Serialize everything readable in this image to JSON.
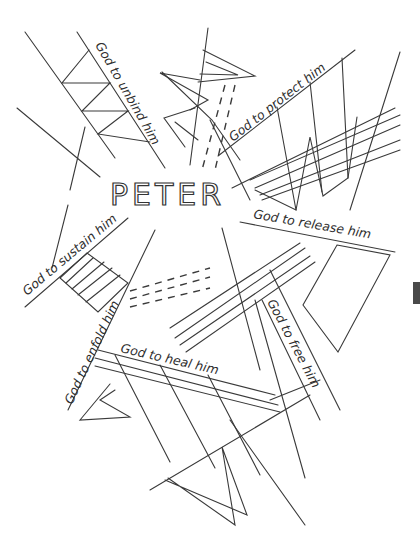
{
  "artwork": {
    "title": "PETER",
    "prayers": [
      {
        "id": "unbind",
        "text": "God to unbind him"
      },
      {
        "id": "protect",
        "text": "God to protect him"
      },
      {
        "id": "release",
        "text": "God to release him"
      },
      {
        "id": "sustain",
        "text": "God to sustain him"
      },
      {
        "id": "enfold",
        "text": "God to enfold him"
      },
      {
        "id": "heal",
        "text": "God to heal him"
      },
      {
        "id": "free",
        "text": "God to free him"
      }
    ],
    "ink_color": "#3a3a3a",
    "background": "#ffffff"
  }
}
